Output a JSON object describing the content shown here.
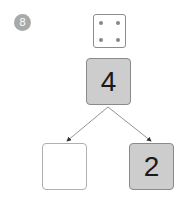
{
  "problem": {
    "number": "8",
    "die": {
      "pips": 4
    },
    "whole": "4",
    "parts": [
      "",
      "2"
    ]
  },
  "colors": {
    "badge": "#a9a9a9",
    "filled_box": "#cdcdcd",
    "border": "#8a8a8a",
    "arrow": "#777777"
  }
}
